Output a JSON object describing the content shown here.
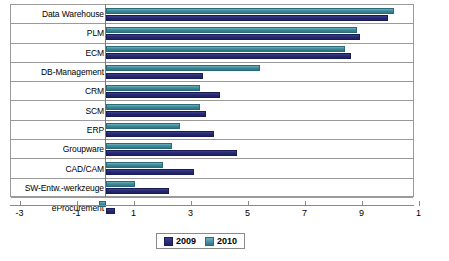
{
  "chart_data": {
    "type": "bar",
    "orientation": "horizontal",
    "title": "",
    "xlabel": "",
    "ylabel": "",
    "xlim": [
      -3,
      11
    ],
    "xticks": [
      -3,
      -1,
      1,
      3,
      5,
      7,
      9,
      11
    ],
    "xtick_labels": [
      "-3",
      "-1",
      "1",
      "3",
      "5",
      "7",
      "9",
      "1"
    ],
    "grid": false,
    "legend_position": "bottom",
    "categories": [
      "Data Warehouse",
      "PLM",
      "ECM",
      "DB-Management",
      "CRM",
      "SCM",
      "ERP",
      "Groupware",
      "CAD/CAM",
      "SW-Entw.-werkzeuge",
      "eProcurement"
    ],
    "series": [
      {
        "name": "2009",
        "color": "#272a70",
        "values": [
          9.9,
          8.9,
          8.6,
          3.4,
          4.0,
          3.5,
          3.8,
          4.6,
          3.1,
          2.2,
          0.3
        ]
      },
      {
        "name": "2010",
        "color": "#3f8a99",
        "values": [
          10.1,
          8.8,
          8.4,
          5.4,
          3.3,
          3.3,
          2.6,
          2.3,
          2.0,
          1.0,
          -0.25
        ]
      }
    ]
  },
  "legend": {
    "items": [
      {
        "label": "2009",
        "color": "#272a70"
      },
      {
        "label": "2010",
        "color": "#3f8a99"
      }
    ]
  }
}
